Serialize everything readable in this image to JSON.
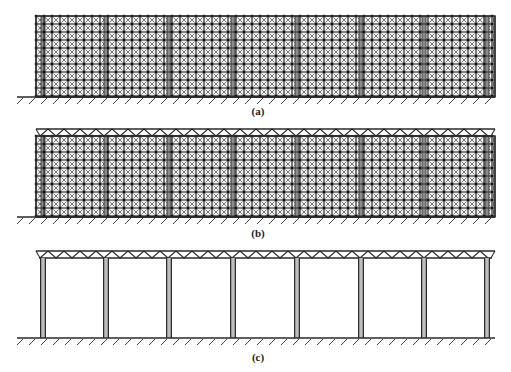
{
  "figure": {
    "panels": [
      {
        "id": "a",
        "caption": "(a)",
        "caption_pos": [
          258,
          112
        ],
        "type": "braced-grid",
        "grid": {
          "x0": 36,
          "x1": 495,
          "y0": 16,
          "y1": 97,
          "cell": 8
        },
        "truss": false,
        "ground": {
          "y": 97,
          "x0": 17,
          "x1": 495
        }
      },
      {
        "id": "b",
        "caption": "(b)",
        "caption_pos": [
          258,
          234
        ],
        "type": "braced-grid-with-roof-truss",
        "grid": {
          "x0": 36,
          "x1": 495,
          "y0": 136,
          "y1": 217,
          "cell": 8
        },
        "truss": {
          "x0": 36,
          "x1": 495,
          "y0": 129,
          "y1": 136,
          "panel": 16
        },
        "ground": {
          "y": 217,
          "x0": 17,
          "x1": 495
        }
      },
      {
        "id": "c",
        "caption": "(c)",
        "caption_pos": [
          258,
          358
        ],
        "type": "portal-frame-with-roof-truss",
        "truss": {
          "x0": 36,
          "x1": 495,
          "y0": 251,
          "y1": 258,
          "panel": 16
        },
        "columns_x": [
          43,
          106,
          169,
          233,
          297,
          361,
          424,
          487
        ],
        "column_top": 258,
        "ground": {
          "y": 338,
          "x0": 17,
          "x1": 495
        }
      }
    ],
    "strip_x": [
      43,
      106,
      169,
      233,
      297,
      361,
      424,
      487
    ],
    "colors": {
      "line": "#2a2a2a",
      "fill": "#9a9a9a",
      "brace": "#555555",
      "strip": "#8c8c8c"
    }
  }
}
